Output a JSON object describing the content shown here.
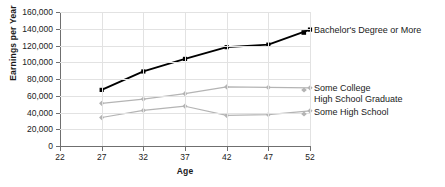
{
  "chart_data": {
    "type": "line",
    "title": "",
    "xlabel": "Age",
    "ylabel": "Earnings per Year",
    "x": [
      27,
      32,
      37,
      42,
      47,
      52
    ],
    "xlim": [
      22,
      52
    ],
    "ylim": [
      0,
      160000
    ],
    "xticks": [
      "22",
      "27",
      "32",
      "37",
      "42",
      "47",
      "52"
    ],
    "xtick_values": [
      22,
      27,
      32,
      37,
      42,
      47,
      52
    ],
    "yticks": [
      "0",
      "20,000",
      "40,000",
      "60,000",
      "80,000",
      "100,000",
      "120,000",
      "140,000",
      "160,000"
    ],
    "ytick_values": [
      0,
      20000,
      40000,
      60000,
      80000,
      100000,
      120000,
      140000,
      160000
    ],
    "grid": true,
    "legend_position": "right",
    "series": [
      {
        "name": "Bachelor's Degree or More",
        "color": "#000000",
        "marker": "square",
        "values": [
          67000,
          89000,
          104000,
          118000,
          121000,
          139000
        ]
      },
      {
        "name": "Some College",
        "color": "#b4b4b4",
        "marker": "diamond",
        "values": [
          51000,
          56000,
          62500,
          70500,
          70000,
          69500
        ]
      },
      {
        "name": "Some High School",
        "color": "#b4b4b4",
        "marker": "diamond",
        "values": [
          34000,
          42500,
          47500,
          36500,
          37500,
          42000
        ]
      }
    ],
    "legend_entries": [
      {
        "label": "Bachelor's Degree or More",
        "marker": "square",
        "color": "#000000"
      },
      {
        "label": "Some College",
        "marker": "diamond",
        "color": "#b4b4b4"
      },
      {
        "label": "High School Graduate",
        "marker": "none",
        "color": "#b4b4b4"
      },
      {
        "label": "Some High School",
        "marker": "diamond",
        "color": "#b4b4b4"
      }
    ],
    "colors": {
      "grid": "#e2e2e2",
      "axis": "#6f6f6f",
      "text": "#1a1a1a",
      "background": "#ffffff"
    }
  }
}
